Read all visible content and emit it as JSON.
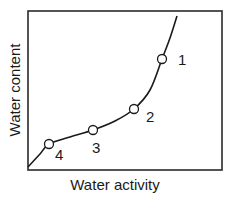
{
  "chart_data": {
    "type": "line",
    "title": "",
    "xlabel": "Water activity",
    "ylabel": "Water content",
    "grid": false,
    "legend": null,
    "curve_points_px": [
      [
        28,
        167
      ],
      [
        40,
        154
      ],
      [
        49,
        144
      ],
      [
        70,
        137
      ],
      [
        93,
        130
      ],
      [
        115,
        121
      ],
      [
        134,
        109
      ],
      [
        150,
        90
      ],
      [
        162,
        59
      ],
      [
        170,
        38
      ],
      [
        177,
        16
      ]
    ],
    "markers": [
      {
        "label": "1",
        "x": 162,
        "y": 59,
        "label_x": 178,
        "label_y": 65
      },
      {
        "label": "2",
        "x": 134,
        "y": 109,
        "label_x": 146,
        "label_y": 122
      },
      {
        "label": "3",
        "x": 93,
        "y": 130,
        "label_x": 92,
        "label_y": 153
      },
      {
        "label": "4",
        "x": 49,
        "y": 144,
        "label_x": 55,
        "label_y": 160
      }
    ],
    "frame": {
      "left": 28,
      "top": 11,
      "right": 222,
      "bottom": 170
    },
    "colors": {
      "line": "#1a1a1a",
      "marker_fill": "#ffffff",
      "frame": "#2a2a2a"
    }
  }
}
